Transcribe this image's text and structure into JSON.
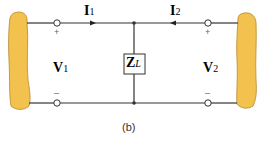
{
  "diagram": {
    "type": "two-port network with shunt load impedance",
    "labels": {
      "i1": {
        "main": "I",
        "sub": "1"
      },
      "i2": {
        "main": "I",
        "sub": "2"
      },
      "v1": {
        "main": "V",
        "sub": "1"
      },
      "v2": {
        "main": "V",
        "sub": "2"
      },
      "zl": {
        "main": "Z",
        "sub": "L"
      },
      "plus_left": "+",
      "minus_left": "–",
      "plus_right": "+",
      "minus_right": "–"
    },
    "caption": "(b)",
    "colors": {
      "network_fill": "#f2c14e",
      "network_stroke": "#b8892a",
      "wire": "#333333"
    }
  }
}
